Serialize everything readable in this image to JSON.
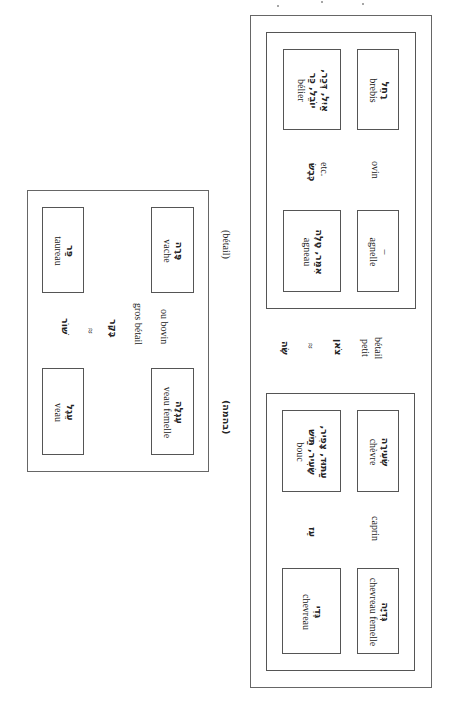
{
  "diagram": {
    "orientation": "rotated 90 degrees clockwise",
    "bovine_group": {
      "hebrew_term": "שׁוֹר",
      "equals": "≈",
      "hebrew_collective": "בָּקָר",
      "french_label_line1": "gros bétail",
      "french_label_line2": "ou bovin",
      "outer_note_fr": "(bétail)",
      "outer_note_he": "(בהמה)",
      "cells": [
        {
          "hebrew": "פַּר",
          "french": "taureau"
        },
        {
          "hebrew": "פָּרָה",
          "french": "vache"
        },
        {
          "hebrew": "עֵגֶל",
          "french": "veau"
        },
        {
          "hebrew": "עֶגְלָה",
          "french": "veau femelle"
        }
      ]
    },
    "small_livestock_group": {
      "hebrew_term": "שֶׂה",
      "equals": "≈",
      "hebrew_collective": "צֹאן",
      "french_label_line1": "petit",
      "french_label_line2": "bétail",
      "ovine": {
        "hebrew_term": "כֶּבֶשׂ",
        "etc": "etc.",
        "french_label": "ovin",
        "cells": [
          {
            "hebrew_line1": "אַיִל, דְּכַר,",
            "hebrew_line2": "יוֹבֵל, כַּר",
            "french": "bélier"
          },
          {
            "hebrew": "רָחֵל",
            "french": "brebis"
          },
          {
            "hebrew": "אִמַּר, טָלֶה",
            "french": "agneau"
          },
          {
            "hebrew": "–",
            "french": "agnelle"
          }
        ]
      },
      "caprine": {
        "hebrew_term": "עֵז",
        "french_label": "caprin",
        "cells": [
          {
            "hebrew_line1": "עַתּוּד, צָפִיר,",
            "hebrew_line2": "שָׂעִיר, תַּיִשׁ",
            "french": "bouc"
          },
          {
            "hebrew": "שְׂעִירָה",
            "french": "chèvre"
          },
          {
            "hebrew": "גְּדִי",
            "french": "chevreau"
          },
          {
            "hebrew": "גְּדִיָּה",
            "french": "chevreau femelle"
          }
        ]
      }
    }
  }
}
